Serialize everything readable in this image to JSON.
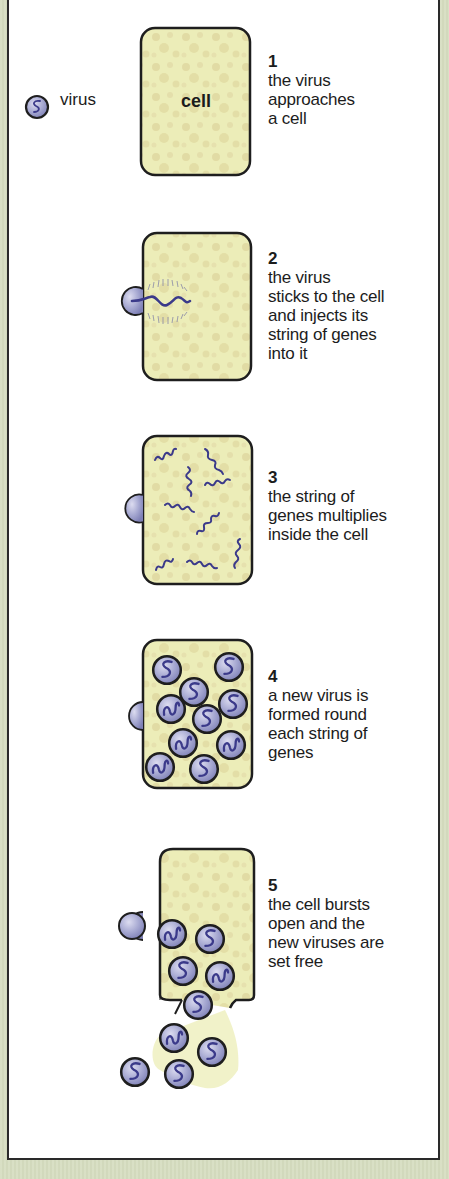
{
  "legend": {
    "virus_label": "virus",
    "cell_label": "cell"
  },
  "colors": {
    "background": "#d6ddc0",
    "panel": "#ffffff",
    "cell_fill": "#ecedb8",
    "cell_speckle": "#d8cf98",
    "virus_fill": "#9fa3cc",
    "virus_gene": "#3b3a8a",
    "outline": "#1e1e1e"
  },
  "steps": [
    {
      "number": "1",
      "description": "the virus\napproaches\na cell"
    },
    {
      "number": "2",
      "description": "the virus\nsticks to the cell\nand injects its\nstring of genes\ninto it"
    },
    {
      "number": "3",
      "description": "the string of\ngenes multiplies\ninside the cell"
    },
    {
      "number": "4",
      "description": "a new virus is\nformed round\neach string of\ngenes"
    },
    {
      "number": "5",
      "description": "the cell bursts\nopen and the\nnew viruses are\nset free"
    }
  ]
}
